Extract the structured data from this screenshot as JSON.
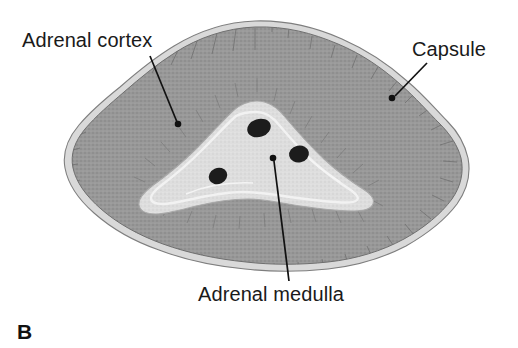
{
  "figure": {
    "panel_letter": "B",
    "labels": {
      "cortex": "Adrenal cortex",
      "capsule": "Capsule",
      "medulla": "Adrenal medulla"
    },
    "colors": {
      "background": "#ffffff",
      "cortex_fill": "#9a9a9a",
      "cortex_stroke": "#6b6b6b",
      "capsule_fill": "#d9d9d9",
      "capsule_stroke": "#8a8a8a",
      "medulla_fill": "#dddddd",
      "medulla_inner": "#eaeaea",
      "medulla_stroke": "#b0b0b0",
      "vessel_fill": "#1c1c1c",
      "leader_line": "#111111",
      "text": "#1a1a1a"
    },
    "structures": [
      {
        "name": "capsule",
        "description": "thin light outer rim surrounding the gland"
      },
      {
        "name": "adrenal cortex",
        "description": "thick mid-gray stippled outer zone with radial striations"
      },
      {
        "name": "adrenal medulla",
        "description": "pale triangular central region"
      },
      {
        "name": "medullary vessels",
        "description": "three dark blobs inside the medulla"
      }
    ],
    "leaders": [
      {
        "name": "cortex-leader",
        "from": [
          150,
          56
        ],
        "to": [
          178,
          124
        ]
      },
      {
        "name": "capsule-leader",
        "from": [
          426,
          64
        ],
        "to": [
          393,
          97
        ]
      },
      {
        "name": "medulla-leader",
        "from": [
          289,
          281
        ],
        "to": [
          273,
          158
        ]
      }
    ]
  }
}
